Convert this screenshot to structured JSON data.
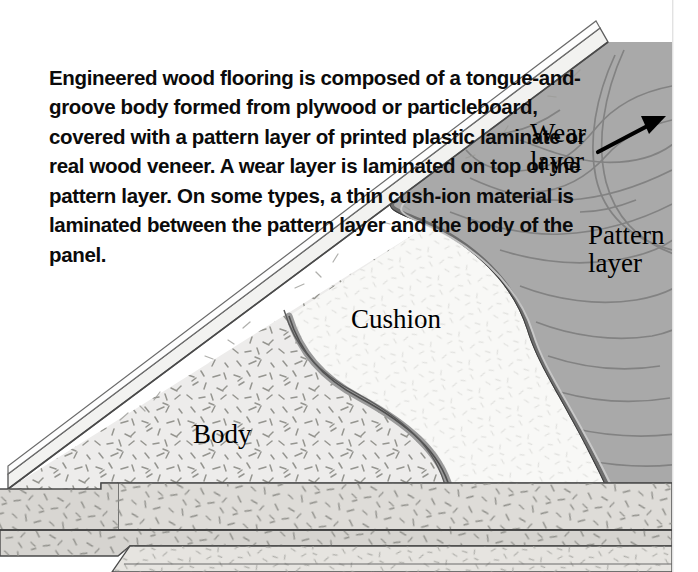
{
  "figure": {
    "kind": "cutaway-illustration",
    "caption_lead": "Engineered wood flooring",
    "caption_rest": " is composed of a tongue-and-groove body formed from plywood or particleboard, covered with a pattern layer of printed plastic laminate or real wood veneer. A wear layer is laminated on top of the pattern layer. On some types, a thin cush-ion material is laminated between the pattern layer and the body of the panel.",
    "caption_lines": [
      "Engineered wood flooring is composed of a tongue-and-",
      "groove body formed from plywood or particleboard,",
      "covered with a pattern layer of printed plastic",
      "laminate or real wood veneer. A wear layer",
      "is laminated on top of the pattern",
      "layer. On some types, a thin cush-",
      "ion material is laminated",
      "between the pattern layer",
      "and the body of the",
      "panel."
    ]
  },
  "labels": {
    "wear": {
      "line1": "Wear",
      "line2": "layer"
    },
    "pattern": {
      "line1": "Pattern",
      "line2": "layer"
    },
    "cushion": "Cushion",
    "body": "Body"
  },
  "colors": {
    "background": "#ffffff",
    "pattern_layer_fill": "#a9a9a9",
    "pattern_layer_edge": "#6f6f6f",
    "wear_layer_fill": "#efefef",
    "cushion_fill": "#f7f7f5",
    "cushion_edge": "#8e8e8e",
    "body_fill": "#e9e9e6",
    "body_side_fill": "#d9d9d4",
    "grain_line": "#7c7c7c",
    "outline": "#4a4a4a",
    "text": "#0b0b0b",
    "arrow": "#000000",
    "speckle": "#9a9a95"
  },
  "arrow": {
    "name": "wear-layer-pointer",
    "from_x": 598,
    "from_y": 152,
    "to_x": 663,
    "to_y": 118
  }
}
